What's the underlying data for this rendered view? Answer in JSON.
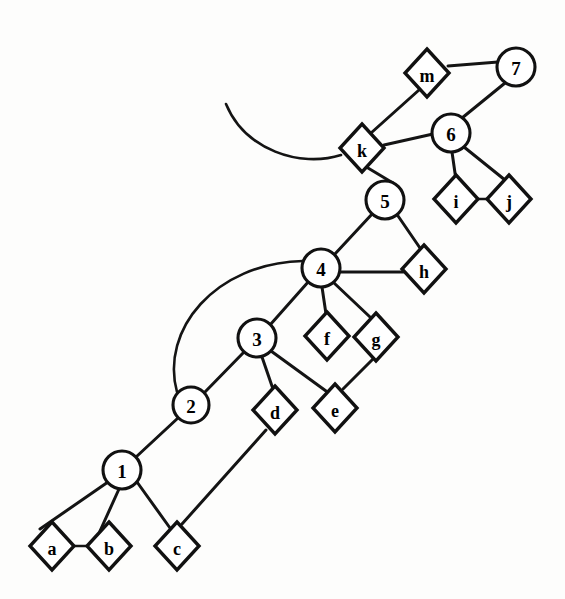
{
  "diagram": {
    "background_color": "#fdfdfc",
    "stroke_color": "#141414",
    "node_fill": "#ffffff",
    "circle_nodes": [
      {
        "id": "1",
        "label": "1",
        "cx": 122,
        "cy": 470,
        "r": 19
      },
      {
        "id": "2",
        "label": "2",
        "cx": 191,
        "cy": 405,
        "r": 18
      },
      {
        "id": "3",
        "label": "3",
        "cx": 257,
        "cy": 338,
        "r": 19
      },
      {
        "id": "4",
        "label": "4",
        "cx": 321,
        "cy": 268,
        "r": 19
      },
      {
        "id": "5",
        "label": "5",
        "cx": 385,
        "cy": 200,
        "r": 19
      },
      {
        "id": "6",
        "label": "6",
        "cx": 451,
        "cy": 133,
        "r": 19
      },
      {
        "id": "7",
        "label": "7",
        "cx": 516,
        "cy": 67,
        "r": 19
      }
    ],
    "diamond_nodes": [
      {
        "id": "a",
        "label": "a",
        "cx": 52,
        "cy": 546,
        "rx": 22,
        "ry": 24
      },
      {
        "id": "b",
        "label": "b",
        "cx": 109,
        "cy": 546,
        "rx": 22,
        "ry": 24
      },
      {
        "id": "c",
        "label": "c",
        "cx": 177,
        "cy": 546,
        "rx": 22,
        "ry": 24
      },
      {
        "id": "d",
        "label": "d",
        "cx": 275,
        "cy": 410,
        "rx": 22,
        "ry": 24
      },
      {
        "id": "e",
        "label": "e",
        "cx": 335,
        "cy": 408,
        "rx": 22,
        "ry": 24
      },
      {
        "id": "f",
        "label": "f",
        "cx": 327,
        "cy": 336,
        "rx": 22,
        "ry": 24
      },
      {
        "id": "g",
        "label": "g",
        "cx": 376,
        "cy": 337,
        "rx": 22,
        "ry": 24
      },
      {
        "id": "h",
        "label": "h",
        "cx": 424,
        "cy": 269,
        "rx": 22,
        "ry": 24
      },
      {
        "id": "i",
        "label": "i",
        "cx": 456,
        "cy": 199,
        "rx": 22,
        "ry": 24
      },
      {
        "id": "j",
        "label": "j",
        "cx": 509,
        "cy": 199,
        "rx": 22,
        "ry": 24
      },
      {
        "id": "k",
        "label": "k",
        "cx": 362,
        "cy": 148,
        "rx": 22,
        "ry": 24
      },
      {
        "id": "m",
        "label": "m",
        "cx": 427,
        "cy": 73,
        "rx": 22,
        "ry": 24
      }
    ],
    "straight_edges": [
      {
        "id": "e-1-a",
        "from": "1",
        "to": "a",
        "x1": 108,
        "y1": 482,
        "x2": 40,
        "y2": 529,
        "width": 3.0
      },
      {
        "id": "e-1-b",
        "from": "1",
        "to": "b",
        "x1": 119,
        "y1": 489,
        "x2": 100,
        "y2": 531,
        "width": 3.0
      },
      {
        "id": "e-1-c",
        "from": "1",
        "to": "c",
        "x1": 137,
        "y1": 482,
        "x2": 170,
        "y2": 528,
        "width": 3.0
      },
      {
        "id": "e-a-b",
        "from": "a",
        "to": "b",
        "x1": 74,
        "y1": 546,
        "x2": 87,
        "y2": 546,
        "width": 2.6
      },
      {
        "id": "e-c-d",
        "from": "c",
        "to": "d",
        "x1": 182,
        "y1": 524,
        "x2": 266,
        "y2": 430,
        "width": 3.0
      },
      {
        "id": "e-1-2",
        "from": "1",
        "to": "2",
        "x1": 136,
        "y1": 457,
        "x2": 178,
        "y2": 418,
        "width": 3.0
      },
      {
        "id": "e-2-3",
        "from": "2",
        "to": "3",
        "x1": 204,
        "y1": 393,
        "x2": 245,
        "y2": 351,
        "width": 3.0
      },
      {
        "id": "e-3-d",
        "from": "3",
        "to": "d",
        "x1": 262,
        "y1": 357,
        "x2": 273,
        "y2": 389,
        "width": 3.0
      },
      {
        "id": "e-3-e",
        "from": "3",
        "to": "e",
        "x1": 271,
        "y1": 351,
        "x2": 326,
        "y2": 391,
        "width": 3.0
      },
      {
        "id": "e-3-4",
        "from": "3",
        "to": "4",
        "x1": 270,
        "y1": 325,
        "x2": 309,
        "y2": 281,
        "width": 3.0
      },
      {
        "id": "e-4-f",
        "from": "4",
        "to": "f",
        "x1": 322,
        "y1": 287,
        "x2": 326,
        "y2": 314,
        "width": 3.0
      },
      {
        "id": "e-4-g",
        "from": "4",
        "to": "g",
        "x1": 333,
        "y1": 282,
        "x2": 370,
        "y2": 317,
        "width": 3.0
      },
      {
        "id": "e-4-h",
        "from": "4",
        "to": "h",
        "x1": 339,
        "y1": 272,
        "x2": 403,
        "y2": 272,
        "width": 3.0
      },
      {
        "id": "e-e-g",
        "from": "e",
        "to": "g",
        "x1": 343,
        "y1": 389,
        "x2": 373,
        "y2": 359,
        "width": 3.0
      },
      {
        "id": "e-4-5",
        "from": "4",
        "to": "5",
        "x1": 334,
        "y1": 255,
        "x2": 373,
        "y2": 213,
        "width": 3.0
      },
      {
        "id": "e-5-h",
        "from": "5",
        "to": "h",
        "x1": 396,
        "y1": 213,
        "x2": 420,
        "y2": 248,
        "width": 3.0
      },
      {
        "id": "e-5-k",
        "from": "5",
        "to": "k",
        "x1": 393,
        "y1": 183,
        "x2": 368,
        "y2": 168,
        "width": 3.0
      },
      {
        "id": "e-k-m",
        "from": "k",
        "to": "m",
        "x1": 371,
        "y1": 133,
        "x2": 419,
        "y2": 90,
        "width": 3.0
      },
      {
        "id": "e-k-6",
        "from": "k",
        "to": "6",
        "x1": 384,
        "y1": 145,
        "x2": 433,
        "y2": 134,
        "width": 3.0
      },
      {
        "id": "e-6-7",
        "from": "6",
        "to": "7",
        "x1": 462,
        "y1": 118,
        "x2": 505,
        "y2": 83,
        "width": 3.0
      },
      {
        "id": "e-m-7",
        "from": "m",
        "to": "7",
        "x1": 448,
        "y1": 66,
        "x2": 498,
        "y2": 62,
        "width": 3.0
      },
      {
        "id": "e-6-i",
        "from": "6",
        "to": "i",
        "x1": 452,
        "y1": 152,
        "x2": 456,
        "y2": 180,
        "width": 3.0
      },
      {
        "id": "e-6-j",
        "from": "6",
        "to": "j",
        "x1": 464,
        "y1": 147,
        "x2": 505,
        "y2": 180,
        "width": 3.0
      },
      {
        "id": "e-i-j",
        "from": "i",
        "to": "j",
        "x1": 478,
        "y1": 199,
        "x2": 487,
        "y2": 199,
        "width": 2.6
      }
    ],
    "curved_edges": [
      {
        "id": "arc-2-4",
        "from": "2",
        "to": "4",
        "path": "M 177 392 C 160 330, 215 263, 303 261",
        "width": 2.6
      },
      {
        "id": "arc-k-open",
        "from": "k",
        "to": "open-end",
        "path": "M 341 155 C 300 168, 245 150, 226 104",
        "width": 2.6
      }
    ]
  }
}
